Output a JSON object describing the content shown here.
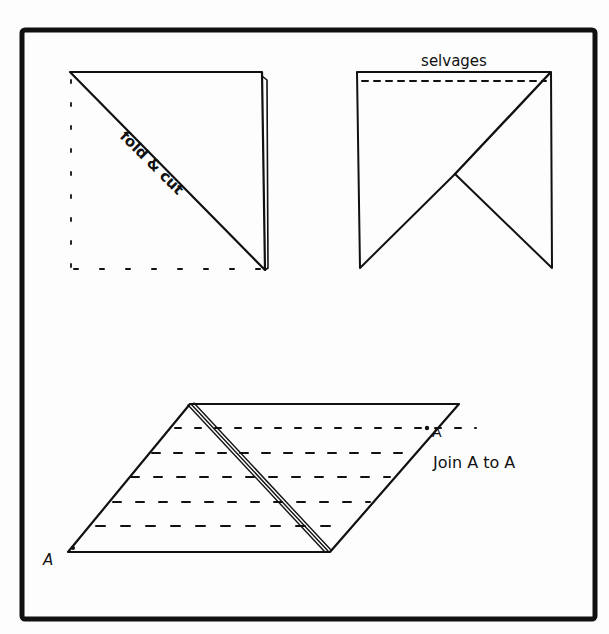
{
  "diagram": {
    "frame": {
      "x": 22,
      "y": 30,
      "width": 573,
      "height": 589,
      "stroke_width": 5,
      "color": "#111111"
    },
    "panels": [
      {
        "id": "fold-and-cut",
        "description": "Square folded diagonally; cut along the fold",
        "label": "fold & cut",
        "label_rotation_deg": 45,
        "label_pos": {
          "x": 118,
          "y": 137
        },
        "top_left": [
          70,
          72
        ],
        "top_right": [
          262,
          72
        ],
        "bottom_right": [
          265,
          270
        ],
        "fold_edge_offset": [
          267,
          80,
          268,
          268
        ],
        "dashed_left": [
          71,
          80,
          71,
          268
        ],
        "dashed_bottom": [
          74,
          269,
          260,
          269
        ]
      },
      {
        "id": "selvages",
        "description": "Two triangles arranged with selvage edges at top",
        "label": "selvages",
        "label_pos": {
          "x": 454,
          "y": 64
        },
        "rect": {
          "left": 357,
          "top": 72,
          "right": 551,
          "bottom": 268
        },
        "dashed_top": [
          362,
          81,
          546,
          81
        ],
        "diagonal": [
          360,
          268,
          550,
          73
        ],
        "vertex": [
          455,
          174
        ],
        "inner_line_end": [
          552,
          268
        ]
      },
      {
        "id": "join-a-to-a",
        "description": "Parallelogram with marked strip lines; join point A to A",
        "label": "Join A to A",
        "label_pos": {
          "x": 433,
          "y": 468
        },
        "parallelogram": [
          [
            190,
            404
          ],
          [
            459,
            404
          ],
          [
            330,
            552
          ],
          [
            68,
            552
          ]
        ],
        "seam_triple_line": {
          "from": [
            190,
            404
          ],
          "to": [
            328,
            552
          ],
          "offset": 3
        },
        "point_labels": [
          {
            "text": "A",
            "x": 44,
            "y": 563,
            "dot": [
              73,
              549
            ]
          },
          {
            "text": "A",
            "x": 433,
            "y": 436,
            "dot": [
              427,
              428
            ]
          }
        ],
        "strip_lines": [
          {
            "y": 428,
            "x1": 175,
            "x2": 476
          },
          {
            "y": 453,
            "x1": 152,
            "x2": 410
          },
          {
            "y": 477,
            "x1": 131,
            "x2": 390
          },
          {
            "y": 502,
            "x1": 113,
            "x2": 370
          },
          {
            "y": 526,
            "x1": 96,
            "x2": 336
          }
        ]
      }
    ]
  }
}
